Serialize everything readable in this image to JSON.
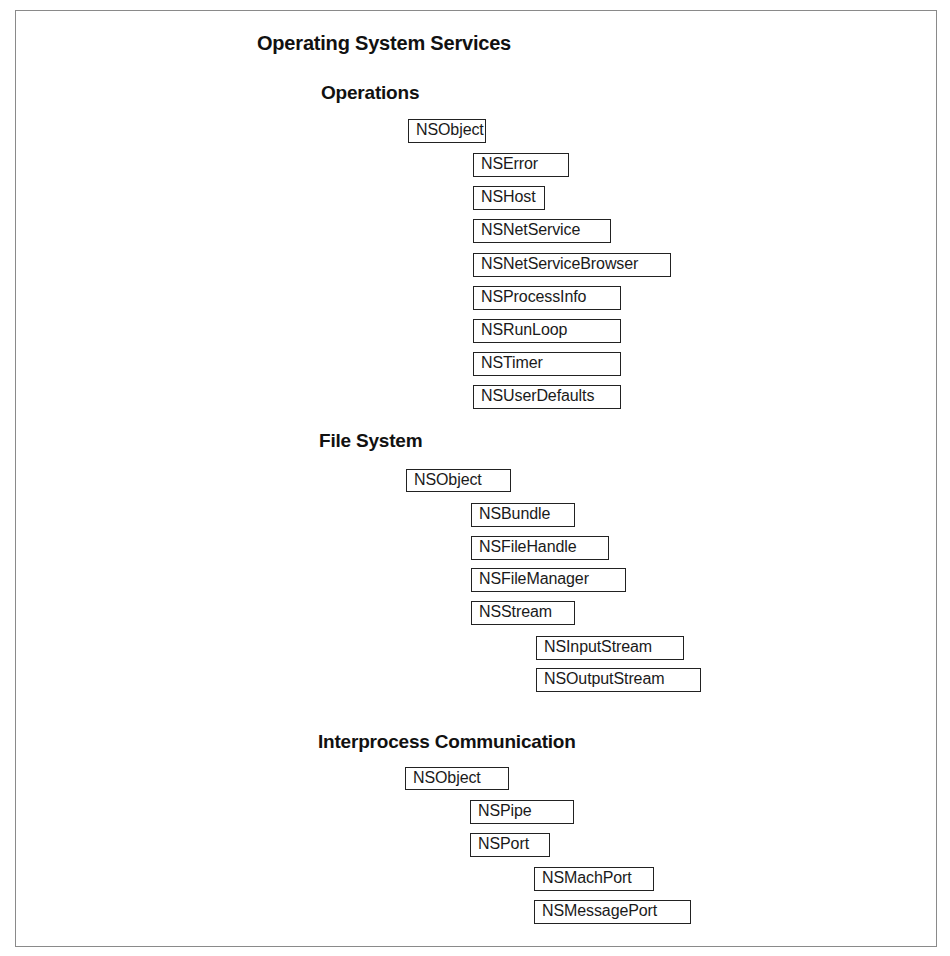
{
  "diagram": {
    "title": "Operating System Services",
    "sections": [
      {
        "heading": "Operations",
        "classes": [
          {
            "name": "NSObject",
            "level": 0
          },
          {
            "name": "NSError",
            "level": 1,
            "parent": "NSObject"
          },
          {
            "name": "NSHost",
            "level": 1,
            "parent": "NSObject"
          },
          {
            "name": "NSNetService",
            "level": 1,
            "parent": "NSObject"
          },
          {
            "name": "NSNetServiceBrowser",
            "level": 1,
            "parent": "NSObject"
          },
          {
            "name": "NSProcessInfo",
            "level": 1,
            "parent": "NSObject"
          },
          {
            "name": "NSRunLoop",
            "level": 1,
            "parent": "NSObject"
          },
          {
            "name": "NSTimer",
            "level": 1,
            "parent": "NSObject"
          },
          {
            "name": "NSUserDefaults",
            "level": 1,
            "parent": "NSObject"
          }
        ]
      },
      {
        "heading": "File System",
        "classes": [
          {
            "name": "NSObject",
            "level": 0
          },
          {
            "name": "NSBundle",
            "level": 1,
            "parent": "NSObject"
          },
          {
            "name": "NSFileHandle",
            "level": 1,
            "parent": "NSObject"
          },
          {
            "name": "NSFileManager",
            "level": 1,
            "parent": "NSObject"
          },
          {
            "name": "NSStream",
            "level": 1,
            "parent": "NSObject"
          },
          {
            "name": "NSInputStream",
            "level": 2,
            "parent": "NSStream"
          },
          {
            "name": "NSOutputStream",
            "level": 2,
            "parent": "NSStream"
          }
        ]
      },
      {
        "heading": "Interprocess Communication",
        "classes": [
          {
            "name": "NSObject",
            "level": 0
          },
          {
            "name": "NSPipe",
            "level": 1,
            "parent": "NSObject"
          },
          {
            "name": "NSPort",
            "level": 1,
            "parent": "NSObject"
          },
          {
            "name": "NSMachPort",
            "level": 2,
            "parent": "NSPort"
          },
          {
            "name": "NSMessagePort",
            "level": 2,
            "parent": "NSPort"
          }
        ]
      }
    ]
  },
  "colors": {
    "box_border": "#222222",
    "frame_border": "#8a8a8a",
    "text": "#1a1a1a",
    "background": "#ffffff"
  }
}
